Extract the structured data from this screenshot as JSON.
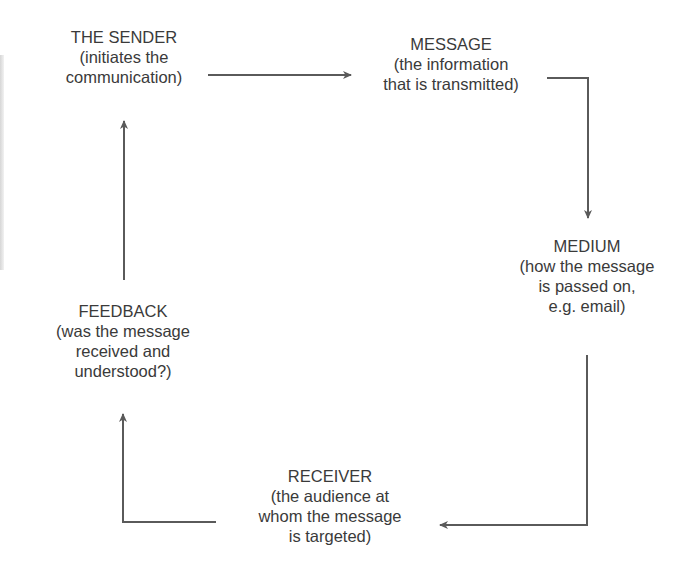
{
  "diagram": {
    "type": "communication-cycle",
    "colors": {
      "text": "#3a3a3a",
      "arrow": "#5a5a5a"
    },
    "nodes": [
      {
        "id": "sender",
        "title": "THE SENDER",
        "lines": [
          "(initiates the",
          "communication)"
        ]
      },
      {
        "id": "message",
        "title": "MESSAGE",
        "lines": [
          "(the information",
          "that is transmitted)"
        ]
      },
      {
        "id": "medium",
        "title": "MEDIUM",
        "lines": [
          "(how the message",
          "is passed on,",
          "e.g. email)"
        ]
      },
      {
        "id": "receiver",
        "title": "RECEIVER",
        "lines": [
          "(the audience at",
          "whom the message",
          "is targeted)"
        ]
      },
      {
        "id": "feedback",
        "title": "FEEDBACK",
        "lines": [
          "(was the message",
          "received and",
          "understood?)"
        ]
      }
    ],
    "edges": [
      {
        "from": "sender",
        "to": "message"
      },
      {
        "from": "message",
        "to": "medium"
      },
      {
        "from": "medium",
        "to": "receiver"
      },
      {
        "from": "receiver",
        "to": "feedback"
      },
      {
        "from": "feedback",
        "to": "sender"
      }
    ]
  }
}
